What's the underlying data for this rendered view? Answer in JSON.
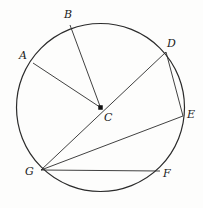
{
  "figure": {
    "kind": "circle-geometry-diagram",
    "width": 203,
    "height": 208,
    "background_color": "#fdfdfc",
    "stroke_color": "#2b2b2b",
    "label_color": "#1a1a1a"
  },
  "circle": {
    "name": "main-circle",
    "center_label": "C",
    "center_x": 100.5,
    "center_y": 107.5,
    "radius": 84,
    "stroke_color": "#2b2b2b",
    "stroke_width": 1.2,
    "fill": "none"
  },
  "center_point": {
    "label": "C",
    "x": 100.5,
    "y": 107.5,
    "marker": "filled-square",
    "marker_size": 4.5
  },
  "points": [
    {
      "id": "A",
      "label": "A",
      "x": 33,
      "y": 63,
      "label_x": 19,
      "label_y": 50
    },
    {
      "id": "B",
      "label": "B",
      "x": 70,
      "y": 25,
      "label_x": 64,
      "label_y": 9
    },
    {
      "id": "D",
      "label": "D",
      "x": 166,
      "y": 52,
      "label_x": 167,
      "label_y": 38
    },
    {
      "id": "E",
      "label": "E",
      "x": 183,
      "y": 116,
      "label_x": 187,
      "label_y": 109
    },
    {
      "id": "F",
      "label": "F",
      "x": 160,
      "y": 171,
      "label_x": 163,
      "label_y": 168
    },
    {
      "id": "G",
      "label": "G",
      "x": 41,
      "y": 170,
      "label_x": 25,
      "label_y": 166
    }
  ],
  "segments": [
    {
      "name": "segment-A-C",
      "from": "A",
      "to": "C",
      "x1": 33,
      "y1": 63,
      "x2": 100.5,
      "y2": 107.5
    },
    {
      "name": "segment-B-C",
      "from": "B",
      "to": "C",
      "x1": 70,
      "y1": 25,
      "x2": 100.5,
      "y2": 107.5
    },
    {
      "name": "segment-D-G",
      "from": "D",
      "to": "G",
      "x1": 166,
      "y1": 52,
      "x2": 41,
      "y2": 170
    },
    {
      "name": "segment-D-E",
      "from": "D",
      "to": "E",
      "x1": 166,
      "y1": 52,
      "x2": 183,
      "y2": 116
    },
    {
      "name": "segment-E-G",
      "from": "E",
      "to": "G",
      "x1": 183,
      "y1": 116,
      "x2": 41,
      "y2": 170
    },
    {
      "name": "segment-F-G",
      "from": "F",
      "to": "G",
      "x1": 160,
      "y1": 171,
      "x2": 41,
      "y2": 170
    }
  ]
}
